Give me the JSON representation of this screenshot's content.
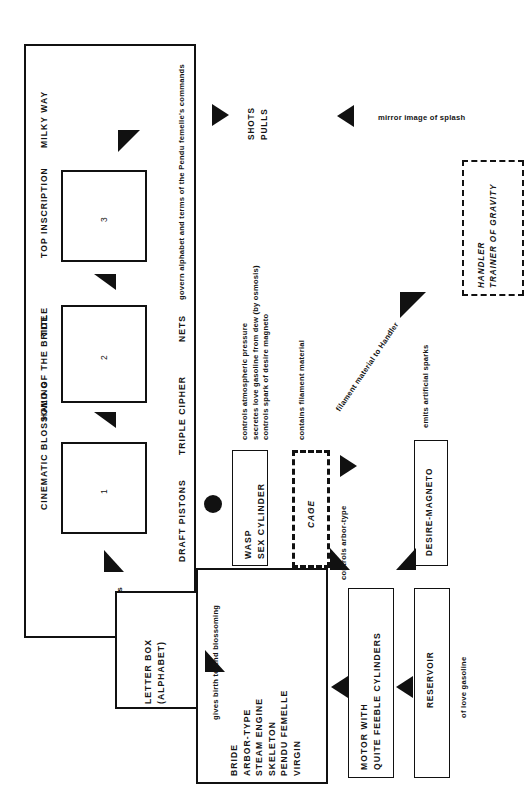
{
  "diagram": {
    "title_strip": {
      "items": [
        {
          "label": "CINEMATIC BLOSSOMING"
        },
        {
          "label": "HALO OF THE BRIDE"
        },
        {
          "label": "TITLE"
        },
        {
          "label": "TOP INSCRIPTION"
        },
        {
          "label": "MILKY WAY"
        }
      ]
    },
    "numbered_panels": [
      {
        "label": "1"
      },
      {
        "label": "2"
      },
      {
        "label": "3"
      }
    ],
    "lower_strip": {
      "items": [
        {
          "label": "DRAFT PISTONS"
        },
        {
          "label": "TRIPLE CIPHER"
        },
        {
          "label": "NETS"
        }
      ],
      "note": "govern alphabet and terms of the Pendu femelle's commands"
    },
    "annotations": {
      "alphabetic_units": "Alphabetic units",
      "gives_birth": "gives birth to 2nd blossoming",
      "mirror_image": "mirror image of splash",
      "shots": "SHOTS",
      "pulls": "PULLS",
      "contains_filament": "contains filament material",
      "filament_to_handler": "filament material to Handler",
      "emits_sparks": "emits artificial sparks",
      "controls_arbor": "controls arbor-type",
      "of_love_gasoline": "of love gasoline"
    },
    "wasp_notes": [
      "controls atmospheric pressure",
      "secretes love gasoline from dew (by osmosis)",
      "controls spark of desire magneto"
    ],
    "boxes": {
      "letter_box": {
        "line1": "LETTER BOX",
        "line2": "(ALPHABET)"
      },
      "bride_list": {
        "items": [
          {
            "label": "BRIDE"
          },
          {
            "label": "ARBOR-TYPE"
          },
          {
            "label": "STEAM ENGINE"
          },
          {
            "label": "SKELETON"
          },
          {
            "label": "PENDU FEMELLE"
          },
          {
            "label": "VIRGIN"
          }
        ]
      },
      "wasp": {
        "line1": "WASP",
        "line2": "SEX CYLINDER"
      },
      "cage": {
        "label": "CAGE"
      },
      "desire_magneto": {
        "label": "DESIRE-MAGNETO"
      },
      "motor": {
        "line1": "MOTOR WITH",
        "line2": "QUITE FEEBLE CYLINDERS"
      },
      "reservoir": {
        "label": "RESERVOIR"
      },
      "handler": {
        "line1": "HANDLER",
        "line2": "TRAINER OF GRAVITY"
      }
    },
    "colors": {
      "ink": "#111111",
      "paper": "#ffffff"
    }
  }
}
